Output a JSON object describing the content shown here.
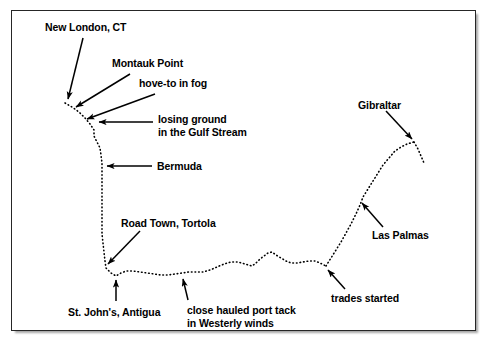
{
  "figure": {
    "kind": "voyage-route-diagram",
    "background_color": "#ffffff",
    "frame_border_color": "#262626",
    "route_color": "#000000",
    "arrow_color": "#000000",
    "route_style": "dotted"
  },
  "labels": {
    "new_london": "New London, CT",
    "montauk_point": "Montauk Point",
    "hove_to_in_fog": "hove-to in fog",
    "losing_ground_line1": "losing ground",
    "losing_ground_line2": "in the Gulf Stream",
    "bermuda": "Bermuda",
    "road_town": "Road Town, Tortola",
    "st_johns": "St. John's, Antigua",
    "close_hauled_line1": "close hauled port tack",
    "close_hauled_line2": "in Westerly winds",
    "trades_started": "trades started",
    "las_palmas": "Las Palmas",
    "gibraltar": "Gibraltar"
  }
}
